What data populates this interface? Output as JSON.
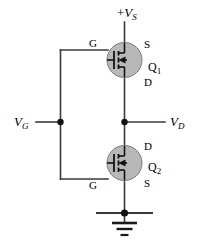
{
  "figure": {
    "name": "cmos-inverter-schematic",
    "type": "circuit-diagram",
    "background_color": "#ffffff",
    "wire_color": "#3a3a3a",
    "symbol_fill_color": "#b8b8b8",
    "symbol_stroke_color": "#1a1a1a",
    "text_color": "#000000"
  },
  "labels": {
    "supply": {
      "sign": "+",
      "symbol": "V",
      "subscript": "S"
    },
    "gate_input": {
      "symbol": "V",
      "subscript": "G"
    },
    "drain_output": {
      "symbol": "V",
      "subscript": "D"
    },
    "q1": {
      "symbol": "Q",
      "subscript": "1"
    },
    "q2": {
      "symbol": "Q",
      "subscript": "2"
    },
    "q1_gate": "G",
    "q1_source": "S",
    "q1_drain": "D",
    "q2_gate": "G",
    "q2_source": "S",
    "q2_drain": "D"
  },
  "components": [
    {
      "id": "q1",
      "label": "Q1",
      "kind": "mosfet",
      "terminals": {
        "top": "S",
        "bottom": "D",
        "left": "G"
      }
    },
    {
      "id": "q2",
      "label": "Q2",
      "kind": "mosfet",
      "terminals": {
        "top": "D",
        "bottom": "S",
        "left": "G"
      }
    },
    {
      "id": "ground",
      "label": "ground",
      "kind": "ground-symbol"
    }
  ],
  "nodes": [
    {
      "id": "gate-bus-junction",
      "label": "VG node"
    },
    {
      "id": "drain-junction",
      "label": "VD node"
    },
    {
      "id": "ground-junction",
      "label": "ground node"
    }
  ]
}
